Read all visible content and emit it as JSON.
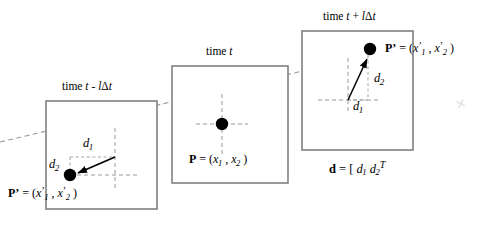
{
  "figure": {
    "name": "optical-flow-displacement-diagram",
    "width": 491,
    "height": 229,
    "background": "#ffffff",
    "stroke_color": "#808080",
    "ink_color": "#000000",
    "dashed_color": "#9a9a9a"
  },
  "frames": [
    {
      "id": "previous",
      "title_prefix": "time ",
      "title_var1": "t",
      "title_minus": " - ",
      "title_l": "l",
      "title_delta": "Δ",
      "title_var2": "t",
      "title_full": "time t - l Δ t",
      "box": {
        "x": 46,
        "y": 101,
        "w": 111,
        "h": 108
      }
    },
    {
      "id": "current",
      "title_prefix": "time ",
      "title_var1": "t",
      "title_full": "time t",
      "box": {
        "x": 172,
        "y": 66,
        "w": 116,
        "h": 117
      }
    },
    {
      "id": "next",
      "title_prefix": "time ",
      "title_var1": "t",
      "title_plus": " + ",
      "title_l": "l",
      "title_delta": "Δ",
      "title_var2": "t",
      "title_full": "time t + l Δ t",
      "box": {
        "x": 302,
        "y": 31,
        "w": 111,
        "h": 119
      }
    }
  ],
  "labels": {
    "point_p_bold": "P",
    "point_pprime_bold": "P",
    "prime_mark": "’",
    "equals": " = (",
    "x_var": "x",
    "comma": " , ",
    "close_paren": " )",
    "sub_1": "1",
    "sub_2": "2",
    "d_letter": "d",
    "d_sub_1": "1",
    "d_sub_2": "2",
    "dvec_bold": "d",
    "dvec_equals": " = [ ",
    "dvec_gap": "  ",
    "dvec_transpose": "T"
  },
  "annotations": {
    "left_point_label": "P’ = (x’1 , x’2 )",
    "center_point_label": "P = (x1 , x2 )",
    "right_point_label": "P’ = (x’1 , x’2 )",
    "d_vector_label": "d = [ d1  d2 ]T",
    "d1_left": "d1",
    "d2_left": "d2",
    "d1_right": "d1",
    "d2_right": "d2"
  },
  "geometry": {
    "trajectory": {
      "x1": 0,
      "y1": 142,
      "x2": 405,
      "y2": 47
    },
    "points": [
      {
        "id": "p-prime-previous",
        "x": 70,
        "y": 175,
        "r": 6.2
      },
      {
        "id": "p-current",
        "x": 222,
        "y": 124,
        "r": 6.2
      },
      {
        "id": "p-prime-next",
        "x": 370,
        "y": 49,
        "r": 6.2
      }
    ],
    "arrows": [
      {
        "id": "displacement-arrow-previous",
        "x1": 115,
        "y1": 157,
        "x2": 75,
        "y2": 174
      },
      {
        "id": "displacement-arrow-next",
        "x1": 348,
        "y1": 100,
        "x2": 368,
        "y2": 55
      }
    ]
  },
  "artifact": {
    "mark": "✕"
  }
}
